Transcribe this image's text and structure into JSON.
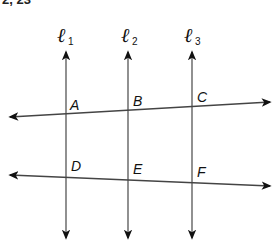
{
  "header": {
    "text": "2, 23"
  },
  "diagram": {
    "vertical_lines": [
      {
        "name": "ℓ",
        "subscript": "1",
        "x": 66
      },
      {
        "name": "ℓ",
        "subscript": "2",
        "x": 128
      },
      {
        "name": "ℓ",
        "subscript": "3",
        "x": 192
      }
    ],
    "transversals": [
      {
        "id": "top",
        "x1": 12,
        "y1": 117,
        "x2": 268,
        "y2": 102
      },
      {
        "id": "bottom",
        "x1": 12,
        "y1": 175,
        "x2": 268,
        "y2": 186
      }
    ],
    "points": [
      {
        "label": "A",
        "x": 66,
        "y": 114
      },
      {
        "label": "B",
        "x": 128,
        "y": 110
      },
      {
        "label": "C",
        "x": 192,
        "y": 106
      },
      {
        "label": "D",
        "x": 66,
        "y": 177
      },
      {
        "label": "E",
        "x": 128,
        "y": 180
      },
      {
        "label": "F",
        "x": 192,
        "y": 183
      }
    ],
    "colors": {
      "line": "#444444",
      "arrow": "#111111"
    }
  }
}
